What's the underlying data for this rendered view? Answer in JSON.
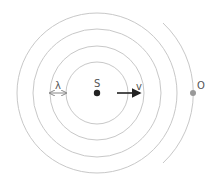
{
  "diagram": {
    "source": {
      "label": "S",
      "color": "#222222"
    },
    "observer": {
      "label": "O",
      "color": "#999999"
    },
    "velocity": {
      "label": "v",
      "color": "#222222"
    },
    "wavelength": {
      "label": "λ",
      "color": "#888888"
    },
    "wavefront_count": 4,
    "wave_color": "#c8c8c8"
  }
}
